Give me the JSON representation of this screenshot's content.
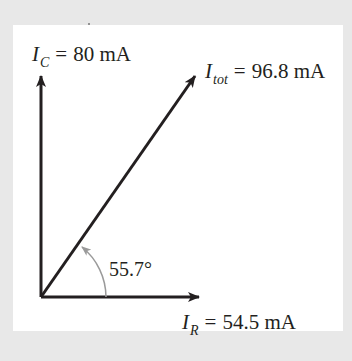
{
  "diagram": {
    "type": "phasor",
    "colors": {
      "background": "#e8e8e8",
      "panel": "#ffffff",
      "vectors": "#231f20",
      "arc": "#9a9a9a"
    },
    "vectors": [
      {
        "id": "ic",
        "symbol": "I",
        "subscript": "C",
        "equals": "=",
        "value": "80 mA",
        "direction": "up"
      },
      {
        "id": "itot",
        "symbol": "I",
        "subscript": "tot",
        "equals": "=",
        "value": "96.8 mA",
        "direction": "diagonal"
      },
      {
        "id": "ir",
        "symbol": "I",
        "subscript": "R",
        "equals": "=",
        "value": "54.5 mA",
        "direction": "right"
      }
    ],
    "angle": {
      "value": "55.7°"
    }
  }
}
